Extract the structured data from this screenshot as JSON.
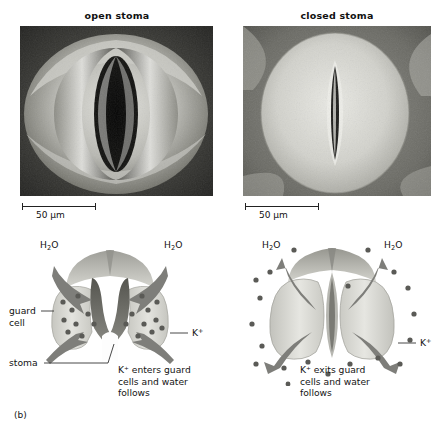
{
  "figure": {
    "label": "(b)",
    "panels": [
      {
        "id": "open",
        "title": "open stoma",
        "scalebar": "50 µm",
        "caption": "K⁺ enters guard\ncells and water\nfollows",
        "labels": {
          "water_left": "H₂O",
          "water_right": "H₂O",
          "guard_cell_line1": "guard",
          "guard_cell_line2": "cell",
          "stoma": "stoma",
          "potassium": "K⁺"
        }
      },
      {
        "id": "closed",
        "title": "closed stoma",
        "scalebar": "50 µm",
        "caption": "K⁺ exits guard\ncells and water\nfollows",
        "labels": {
          "water_left": "H₂O",
          "water_right": "H₂O",
          "potassium": "K⁺"
        }
      }
    ]
  },
  "colors": {
    "page_background": "#ffffff",
    "text": "#141414",
    "leader_line": "#333333",
    "guard_cell_fill": "#d9d9d4",
    "guard_cell_shade": "#b2b2ac",
    "pore_dark": "#6f6f6a",
    "arrow_fill": "#7e7e7a",
    "ion_dot": "#5a5a56",
    "photo_dark": "#2b2b2b",
    "photo_light": "#cfcfcb"
  },
  "icons": {
    "water_arrow": "curved-arrow-icon",
    "ion_dot": "ion-dot-icon",
    "scalebar": "scale-bar-icon"
  }
}
